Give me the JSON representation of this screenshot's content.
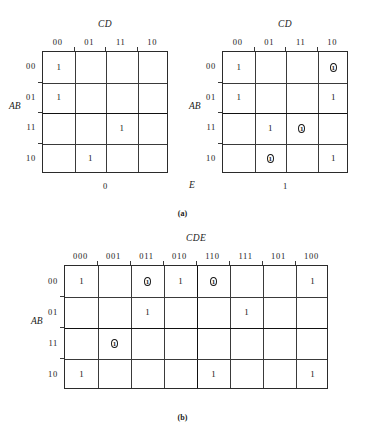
{
  "figure": {
    "caption_a": "(a)",
    "caption_b": "(b)"
  },
  "map_a_left": {
    "top_var": "CD",
    "side_var": "AB",
    "col_headers": [
      "00",
      "01",
      "11",
      "10"
    ],
    "row_headers": [
      "00",
      "01",
      "11",
      "10"
    ],
    "foot_label": "0",
    "cells": [
      [
        "1",
        "",
        "",
        ""
      ],
      [
        "1",
        "",
        "",
        ""
      ],
      [
        "",
        "",
        "1",
        ""
      ],
      [
        "",
        "1",
        "",
        ""
      ]
    ],
    "circled": [
      [
        false,
        false,
        false,
        false
      ],
      [
        false,
        false,
        false,
        false
      ],
      [
        false,
        false,
        false,
        false
      ],
      [
        false,
        false,
        false,
        false
      ]
    ]
  },
  "map_a_right": {
    "top_var": "CD",
    "side_var": "AB",
    "e_label": "E",
    "col_headers": [
      "00",
      "01",
      "11",
      "10"
    ],
    "row_headers": [
      "00",
      "01",
      "11",
      "10"
    ],
    "foot_label": "1",
    "cells": [
      [
        "1",
        "",
        "",
        "1"
      ],
      [
        "1",
        "",
        "",
        "1"
      ],
      [
        "",
        "1",
        "1",
        ""
      ],
      [
        "",
        "1",
        "",
        "1"
      ]
    ],
    "circled": [
      [
        false,
        false,
        false,
        true
      ],
      [
        false,
        false,
        false,
        false
      ],
      [
        false,
        false,
        true,
        false
      ],
      [
        false,
        true,
        false,
        false
      ]
    ]
  },
  "map_b": {
    "top_var": "CDE",
    "side_var": "AB",
    "col_headers": [
      "000",
      "001",
      "011",
      "010",
      "110",
      "111",
      "101",
      "100"
    ],
    "row_headers": [
      "00",
      "01",
      "11",
      "10"
    ],
    "cells": [
      [
        "1",
        "",
        "1",
        "1",
        "1",
        "",
        "",
        "1"
      ],
      [
        "",
        "",
        "1",
        "",
        "",
        "1",
        "",
        ""
      ],
      [
        "",
        "1",
        "",
        "",
        "",
        "",
        "",
        ""
      ],
      [
        "1",
        "",
        "",
        "",
        "1",
        "",
        "",
        "1"
      ]
    ],
    "circled": [
      [
        false,
        false,
        true,
        false,
        true,
        false,
        false,
        false
      ],
      [
        false,
        false,
        false,
        false,
        false,
        false,
        false,
        false
      ],
      [
        false,
        true,
        false,
        false,
        false,
        false,
        false,
        false
      ],
      [
        false,
        false,
        false,
        false,
        false,
        false,
        false,
        false
      ]
    ]
  }
}
